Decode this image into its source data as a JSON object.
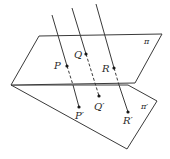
{
  "diagram": {
    "planes": [
      {
        "id": "pi",
        "label": "π"
      },
      {
        "id": "pi_prime",
        "label": "π′"
      }
    ],
    "points": [
      {
        "id": "P",
        "label": "P"
      },
      {
        "id": "Q",
        "label": "Q"
      },
      {
        "id": "R",
        "label": "R"
      },
      {
        "id": "P_prime",
        "label": "P′"
      },
      {
        "id": "Q_prime",
        "label": "Q′"
      },
      {
        "id": "R_prime",
        "label": "R′"
      }
    ],
    "colors": {
      "stroke": "#3a3a3a",
      "background": "#ffffff"
    }
  }
}
